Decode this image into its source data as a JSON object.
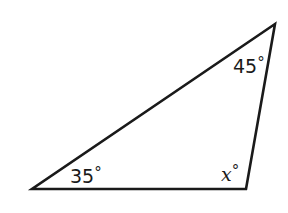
{
  "diagram": {
    "type": "triangle",
    "stroke_color": "#1a1a1a",
    "fill_color": "#ffffff",
    "vertices": {
      "top_right": {
        "x": 275,
        "y": 24
      },
      "bottom_left": {
        "x": 32,
        "y": 189
      },
      "bottom_right": {
        "x": 246,
        "y": 189
      }
    },
    "angles": {
      "top_right": {
        "value": "45",
        "unit": "°",
        "label": "45°"
      },
      "bottom_left": {
        "value": "35",
        "unit": "°",
        "label": "35°"
      },
      "bottom_right": {
        "value": "x",
        "unit": "°",
        "label": "x°"
      }
    }
  }
}
